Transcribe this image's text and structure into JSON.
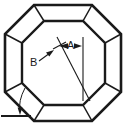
{
  "figure": {
    "kind": "technical-line-drawing",
    "background_color": "#ffffff",
    "line_color": "#1a1a1a",
    "width_px": 127,
    "height_px": 127
  },
  "labels": {
    "dimension_a": "A",
    "dimension_b": "B"
  },
  "annotations": {
    "a_callout": {
      "label": "A",
      "type": "linear-dimension",
      "arrow_left_tip": [
        60,
        46
      ],
      "arrow_right_tip": [
        82,
        46
      ],
      "extension_line_x": 83,
      "extension_line_y_start": 38,
      "extension_line_y_end": 100
    },
    "b_callout": {
      "label": "B",
      "type": "leader",
      "leader_from": [
        39,
        60
      ],
      "leader_to": [
        53,
        50
      ]
    },
    "angle_callout": {
      "label": "",
      "type": "angle-dimension",
      "vertex": [
        24,
        116
      ],
      "baseline_from": [
        1,
        116
      ],
      "baseline_to": [
        30,
        116
      ],
      "arrow_tip": [
        20,
        113
      ]
    },
    "center_diagonal": {
      "type": "construction-line",
      "from": [
        57,
        37
      ],
      "to": [
        90,
        100
      ]
    }
  },
  "geometry": {
    "outer_octagon": [
      [
        34,
        5
      ],
      [
        92,
        5
      ],
      [
        121,
        34
      ],
      [
        121,
        92
      ],
      [
        92,
        121
      ],
      [
        34,
        121
      ],
      [
        5,
        92
      ],
      [
        5,
        34
      ]
    ],
    "inner_octagon": [
      [
        44,
        21
      ],
      [
        83,
        21
      ],
      [
        105,
        43
      ],
      [
        105,
        83
      ],
      [
        83,
        105
      ],
      [
        44,
        105
      ],
      [
        22,
        83
      ],
      [
        22,
        43
      ]
    ]
  }
}
